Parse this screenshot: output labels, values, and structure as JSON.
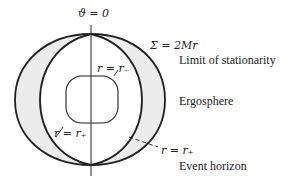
{
  "diagram": {
    "axis_label": "ϑ = 0",
    "outer_surface_label": "Σ = 2Mr",
    "outer_surface_caption": "Limit of stationarity",
    "region_label": "Ergosphere",
    "inner_horizon_label": "r = r₋",
    "outer_horizon_label_left": "r = r₊",
    "outer_horizon_label_right": "r = r₊",
    "outer_horizon_caption": "Event horizon",
    "colors": {
      "stroke": "#222222",
      "ergosphere_fill": "#ececec",
      "background": "#ffffff"
    }
  }
}
